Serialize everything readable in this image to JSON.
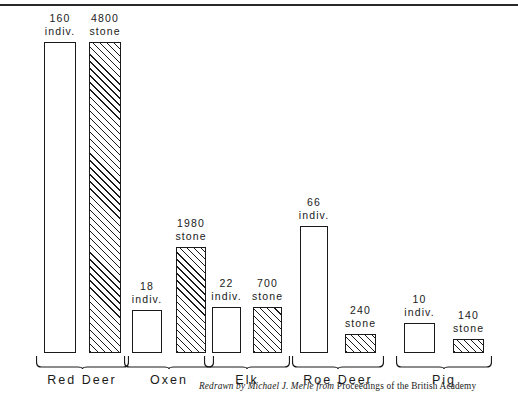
{
  "figure": {
    "credit_italic": "Redrawn by Michael J. Merle from",
    "credit_roman": "Proceedings of the British Academy"
  },
  "chart_data": {
    "type": "bar",
    "title": "",
    "subtitle": "",
    "xlabel": "",
    "ylabel": "",
    "grid": false,
    "legend_position": "none",
    "note": "Paired bars per animal: open bar = number of individuals, hatched bar = weight in stone. Bar heights are drawn to an illustrative (non-linear) scale.",
    "categories": [
      "Red Deer",
      "Oxen",
      "Elk",
      "Roe Deer",
      "Pig"
    ],
    "series": [
      {
        "name": "indiv.",
        "unit": "indiv.",
        "fill": "open",
        "values": [
          160,
          18,
          22,
          66,
          10
        ]
      },
      {
        "name": "stone",
        "unit": "stone",
        "fill": "hatched",
        "values": [
          4800,
          1980,
          700,
          240,
          140
        ]
      }
    ],
    "bars": [
      {
        "group": "Red Deer",
        "series": "indiv.",
        "value": 160,
        "value_text": "160",
        "unit_text": "indiv.",
        "fill": "open",
        "x": 44,
        "y": 42,
        "w": 32,
        "h": 311
      },
      {
        "group": "Red Deer",
        "series": "stone",
        "value": 4800,
        "value_text": "4800",
        "unit_text": "stone",
        "fill": "hatched",
        "x": 89,
        "y": 42,
        "w": 32,
        "h": 311
      },
      {
        "group": "Oxen",
        "series": "indiv.",
        "value": 18,
        "value_text": "18",
        "unit_text": "indiv.",
        "fill": "open",
        "x": 132,
        "y": 310,
        "w": 30,
        "h": 43
      },
      {
        "group": "Oxen",
        "series": "stone",
        "value": 1980,
        "value_text": "1980",
        "unit_text": "stone",
        "fill": "hatched",
        "x": 176,
        "y": 247,
        "w": 30,
        "h": 106
      },
      {
        "group": "Elk",
        "series": "indiv.",
        "value": 22,
        "value_text": "22",
        "unit_text": "indiv.",
        "fill": "open",
        "x": 212,
        "y": 307,
        "w": 29,
        "h": 46
      },
      {
        "group": "Elk",
        "series": "stone",
        "value": 700,
        "value_text": "700",
        "unit_text": "stone",
        "fill": "hatched",
        "x": 253,
        "y": 307,
        "w": 29,
        "h": 46
      },
      {
        "group": "Roe Deer",
        "series": "indiv.",
        "value": 66,
        "value_text": "66",
        "unit_text": "indiv.",
        "fill": "open",
        "x": 300,
        "y": 226,
        "w": 28,
        "h": 127
      },
      {
        "group": "Roe Deer",
        "series": "stone",
        "value": 240,
        "value_text": "240",
        "unit_text": "stone",
        "fill": "hatched",
        "x": 345,
        "y": 334,
        "w": 31,
        "h": 19
      },
      {
        "group": "Pig",
        "series": "indiv.",
        "value": 10,
        "value_text": "10",
        "unit_text": "indiv.",
        "fill": "open",
        "x": 404,
        "y": 323,
        "w": 31,
        "h": 30
      },
      {
        "group": "Pig",
        "series": "stone",
        "value": 140,
        "value_text": "140",
        "unit_text": "stone",
        "fill": "hatched",
        "x": 453,
        "y": 339,
        "w": 31,
        "h": 14
      }
    ],
    "group_labels": [
      {
        "text": "Red Deer",
        "cx": 82,
        "brace_x": 36,
        "brace_w": 93
      },
      {
        "text": "Oxen",
        "cx": 169,
        "brace_x": 124,
        "brace_w": 90
      },
      {
        "text": "Elk",
        "cx": 247,
        "brace_x": 204,
        "brace_w": 86
      },
      {
        "text": "Roe Deer",
        "cx": 338,
        "brace_x": 292,
        "brace_w": 92
      },
      {
        "text": "Pig",
        "cx": 444,
        "brace_x": 396,
        "brace_w": 96
      }
    ],
    "ylim": [
      0,
      4800
    ]
  }
}
